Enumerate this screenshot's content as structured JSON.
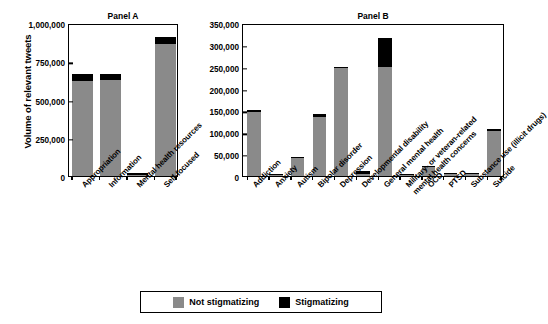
{
  "axis": {
    "ylabel": "Volume of relevant tweets"
  },
  "legend": {
    "items": [
      {
        "label": "Not stigmatizing",
        "color": "#8a8a8a",
        "key": "not_stigmatizing"
      },
      {
        "label": "Stigmatizing",
        "color": "#000000",
        "key": "stigmatizing"
      }
    ]
  },
  "chart_data": [
    {
      "type": "bar",
      "title": "Panel A",
      "stacked": true,
      "xlabel": "",
      "ylabel": "Volume of relevant tweets",
      "ylim": [
        0,
        1000000
      ],
      "yticks": [
        0,
        250000,
        500000,
        750000,
        1000000
      ],
      "ytick_labels": [
        "0",
        "250,000",
        "500,000",
        "750,000",
        "1,000,000"
      ],
      "grid": false,
      "legend_position": "bottom-outside",
      "categories": [
        "Appropriation",
        "Information",
        "Mental health resources",
        "Self-focused"
      ],
      "series": [
        {
          "name": "Not stigmatizing",
          "color": "#8a8a8a",
          "values": [
            620000,
            625000,
            9000,
            865000
          ]
        },
        {
          "name": "Stigmatizing",
          "color": "#000000",
          "values": [
            45000,
            45000,
            1000,
            45000
          ]
        }
      ],
      "totals": [
        665000,
        670000,
        10000,
        910000
      ]
    },
    {
      "type": "bar",
      "title": "Panel B",
      "stacked": true,
      "xlabel": "",
      "ylabel": "Volume of relevant tweets",
      "ylim": [
        0,
        350000
      ],
      "yticks": [
        0,
        50000,
        100000,
        150000,
        200000,
        250000,
        300000,
        350000
      ],
      "ytick_labels": [
        "0",
        "50,000",
        "100,000",
        "150,000",
        "200,000",
        "250,000",
        "300,000",
        "350,000"
      ],
      "grid": false,
      "legend_position": "bottom-outside",
      "categories": [
        "Addiction",
        "Anxiety",
        "Autism",
        "Bipolar disorder",
        "Depression",
        "Developmental disability",
        "General mental health",
        "Military- or veteran-related mental health concerns",
        "OCD",
        "PTSD",
        "Substance use (illicit drugs)",
        "Suicide"
      ],
      "series": [
        {
          "name": "Not stigmatizing",
          "color": "#8a8a8a",
          "values": [
            147000,
            2000,
            41000,
            134000,
            247000,
            4000,
            250000,
            1500,
            20000,
            3500,
            4500,
            104000
          ]
        },
        {
          "name": "Stigmatizing",
          "color": "#000000",
          "values": [
            4000,
            300,
            600,
            7000,
            2000,
            6500,
            65000,
            300,
            500,
            300,
            500,
            1500
          ]
        }
      ],
      "totals": [
        151000,
        2300,
        41600,
        141000,
        249000,
        10500,
        315000,
        1800,
        20500,
        3800,
        5000,
        105500
      ]
    }
  ]
}
